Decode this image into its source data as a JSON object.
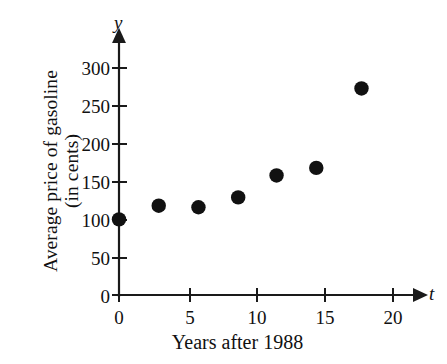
{
  "chart_data": {
    "type": "scatter",
    "title": "",
    "xlabel": "Years after 1988",
    "ylabel": "Average price of gasoline (in cents)",
    "ylabel_lines": [
      "Average price of gasoline",
      "(in cents)"
    ],
    "x_axis_variable": "t",
    "y_axis_variable": "y",
    "xlim": [
      0,
      21.5
    ],
    "ylim": [
      0,
      325
    ],
    "xticks": [
      0,
      5,
      10,
      15,
      20
    ],
    "xtick_labels": [
      "0",
      "5",
      "10",
      "15",
      "20"
    ],
    "yticks": [
      0,
      50,
      100,
      150,
      200,
      250,
      300
    ],
    "ytick_labels": [
      "0",
      "50",
      "100",
      "150",
      "200",
      "250",
      "300"
    ],
    "grid": false,
    "legend": null,
    "marker": "filled-circle",
    "marker_color": "#111111",
    "points": [
      {
        "x": 0.0,
        "y": 100
      },
      {
        "x": 2.9,
        "y": 118
      },
      {
        "x": 5.8,
        "y": 116
      },
      {
        "x": 8.7,
        "y": 129
      },
      {
        "x": 11.5,
        "y": 158
      },
      {
        "x": 14.4,
        "y": 168
      },
      {
        "x": 17.7,
        "y": 273
      }
    ]
  },
  "axes": {
    "y_var_label": "y",
    "x_var_label": "t"
  }
}
